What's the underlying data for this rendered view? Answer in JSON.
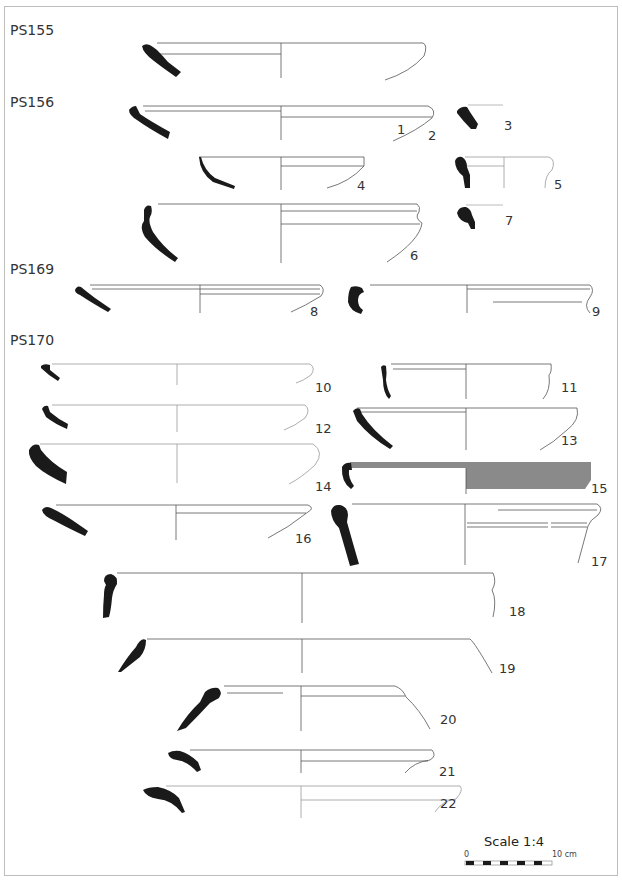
{
  "figure": {
    "groups": [
      {
        "label": "PS155",
        "x": 10,
        "y": 22
      },
      {
        "label": "PS156",
        "x": 10,
        "y": 94
      },
      {
        "label": "PS169",
        "x": 10,
        "y": 261
      },
      {
        "label": "PS170",
        "x": 10,
        "y": 332
      }
    ],
    "vessels": [
      {
        "n": "1",
        "x": 397,
        "y": 122
      },
      {
        "n": "2",
        "x": 428,
        "y": 128
      },
      {
        "n": "3",
        "x": 504,
        "y": 118
      },
      {
        "n": "4",
        "x": 357,
        "y": 178
      },
      {
        "n": "5",
        "x": 554,
        "y": 177
      },
      {
        "n": "6",
        "x": 410,
        "y": 248
      },
      {
        "n": "7",
        "x": 505,
        "y": 213
      },
      {
        "n": "8",
        "x": 310,
        "y": 304
      },
      {
        "n": "9",
        "x": 592,
        "y": 304
      },
      {
        "n": "10",
        "x": 315,
        "y": 380
      },
      {
        "n": "11",
        "x": 561,
        "y": 380
      },
      {
        "n": "12",
        "x": 315,
        "y": 421
      },
      {
        "n": "13",
        "x": 561,
        "y": 433
      },
      {
        "n": "14",
        "x": 315,
        "y": 479
      },
      {
        "n": "15",
        "x": 591,
        "y": 481
      },
      {
        "n": "16",
        "x": 295,
        "y": 531
      },
      {
        "n": "17",
        "x": 591,
        "y": 554
      },
      {
        "n": "18",
        "x": 509,
        "y": 604
      },
      {
        "n": "19",
        "x": 499,
        "y": 661
      },
      {
        "n": "20",
        "x": 440,
        "y": 712
      },
      {
        "n": "21",
        "x": 439,
        "y": 764
      },
      {
        "n": "22",
        "x": 440,
        "y": 796
      }
    ],
    "scale": {
      "title": "Scale 1:4",
      "start": "0",
      "end": "10 cm"
    },
    "colors": {
      "sherd_fill": "#1a1a1a",
      "line": "#555555",
      "shaded": "#8a8a8a",
      "frame": "#bdbdbd"
    }
  }
}
